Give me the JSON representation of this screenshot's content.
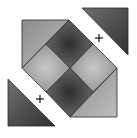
{
  "figure": {
    "colors": {
      "background": "#ffffff",
      "dark": "#3a3a3a",
      "mid": "#8a8a8a",
      "light": "#b8b8b8",
      "outline": "#2a2a2a"
    },
    "pieces": [
      {
        "name": "top-square",
        "shade": "dark"
      },
      {
        "name": "bottom-square",
        "shade": "dark"
      },
      {
        "name": "left-square",
        "shade": "light"
      },
      {
        "name": "right-square",
        "shade": "light"
      },
      {
        "name": "top-left-corner",
        "shade": "light"
      },
      {
        "name": "bottom-right-corner",
        "shade": "light"
      },
      {
        "name": "detached-top-right-triangle",
        "shade": "dark"
      },
      {
        "name": "detached-bottom-left-triangle",
        "shade": "dark"
      }
    ],
    "markers": [
      {
        "symbol": "+",
        "x": 99,
        "y": 38
      },
      {
        "symbol": "+",
        "x": 40,
        "y": 99
      }
    ]
  }
}
